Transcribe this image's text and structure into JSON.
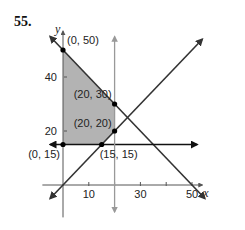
{
  "problem_number": "55.",
  "chart_data": {
    "type": "line",
    "title": "",
    "xlabel": "x",
    "ylabel": "y",
    "x_ticks": [
      10,
      30,
      50
    ],
    "x_minor_ticks": [
      10,
      20,
      30,
      40,
      50
    ],
    "y_ticks": [
      20,
      40
    ],
    "xlim": [
      -5,
      55
    ],
    "ylim": [
      -12,
      58
    ],
    "grid": false,
    "lines": [
      {
        "name": "x + y = 50",
        "color": "#333333",
        "points": [
          [
            -5,
            55
          ],
          [
            55,
            -5
          ]
        ],
        "arrows": "both"
      },
      {
        "name": "y = x",
        "color": "#333333",
        "points": [
          [
            -5,
            -5
          ],
          [
            54,
            54
          ]
        ],
        "arrows": "both"
      },
      {
        "name": "y = 15",
        "color": "#111111",
        "points": [
          [
            -5,
            15
          ],
          [
            52,
            15
          ]
        ],
        "arrows": "both"
      },
      {
        "name": "x = 20",
        "color": "#999999",
        "points": [
          [
            20,
            -10
          ],
          [
            20,
            55
          ]
        ],
        "arrows": "both"
      }
    ],
    "shaded_region": {
      "color": "#b3b3b3",
      "vertices": [
        [
          0,
          50
        ],
        [
          20,
          30
        ],
        [
          20,
          20
        ],
        [
          15,
          15
        ],
        [
          0,
          15
        ]
      ]
    },
    "labeled_points": [
      {
        "label": "(0, 50)",
        "x": 0,
        "y": 50
      },
      {
        "label": "(20, 30)",
        "x": 20,
        "y": 30
      },
      {
        "label": "(20, 20)",
        "x": 20,
        "y": 20
      },
      {
        "label": "(0, 15)",
        "x": 0,
        "y": 15
      },
      {
        "label": "(15, 15)",
        "x": 15,
        "y": 15
      }
    ]
  }
}
